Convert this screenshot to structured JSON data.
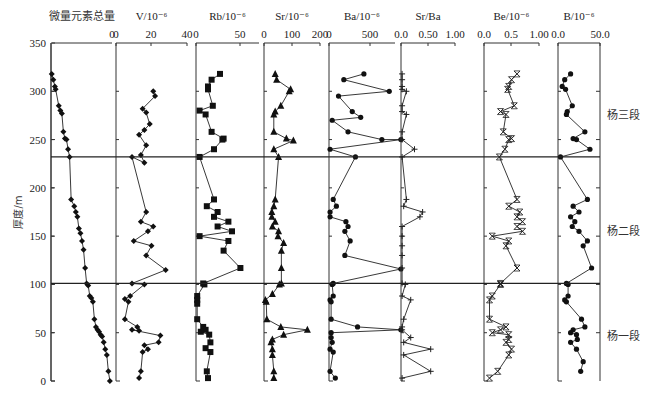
{
  "chart_data": {
    "type": "line",
    "title": "",
    "ylabel": "厚度/m",
    "ylim": [
      0,
      350
    ],
    "yticks": [
      0,
      50,
      100,
      150,
      200,
      250,
      300,
      350
    ],
    "boundaries": [
      {
        "depth": 232,
        "label": "杨三段 / 杨二段 boundary"
      },
      {
        "depth": 101,
        "label": "杨二段 / 杨一段 boundary"
      }
    ],
    "zones": [
      {
        "label": "杨三段",
        "label_depth": 275
      },
      {
        "label": "杨二段",
        "label_depth": 155
      },
      {
        "label": "杨一段",
        "label_depth": 47
      }
    ],
    "panels": [
      {
        "name": "微量元素总量",
        "marker": "diamond",
        "xlim": null,
        "xticks": [],
        "points": [
          [
            0.5,
            318
          ],
          [
            1.5,
            312
          ],
          [
            2.5,
            305
          ],
          [
            3,
            302
          ],
          [
            5,
            285
          ],
          [
            6,
            280
          ],
          [
            7,
            277
          ],
          [
            8,
            258
          ],
          [
            9,
            251
          ],
          [
            10,
            250
          ],
          [
            11,
            240
          ],
          [
            12,
            232
          ],
          [
            13,
            188
          ],
          [
            15,
            181
          ],
          [
            16,
            175
          ],
          [
            17,
            170
          ],
          [
            18,
            158
          ],
          [
            19,
            153
          ],
          [
            20,
            145
          ],
          [
            21,
            136
          ],
          [
            22,
            117
          ],
          [
            23,
            101
          ],
          [
            24,
            99
          ],
          [
            25,
            88
          ],
          [
            26,
            86
          ],
          [
            27,
            82
          ],
          [
            28,
            64
          ],
          [
            29,
            56
          ],
          [
            30,
            53
          ],
          [
            31,
            51
          ],
          [
            32,
            48
          ],
          [
            33,
            46
          ],
          [
            34,
            40
          ],
          [
            35,
            33
          ],
          [
            36,
            27
          ],
          [
            37,
            10
          ],
          [
            38,
            0
          ]
        ]
      },
      {
        "name": "V/10⁻⁶",
        "marker": "diamond",
        "xlim": [
          0,
          40
        ],
        "xticks": [
          "0",
          "20",
          "40"
        ],
        "points": [
          [
            21,
            300
          ],
          [
            22,
            295
          ],
          [
            15,
            282
          ],
          [
            17,
            278
          ],
          [
            19,
            266
          ],
          [
            16,
            260
          ],
          [
            13,
            255
          ],
          [
            17,
            244
          ],
          [
            14,
            234
          ],
          [
            16,
            226
          ],
          [
            9,
            232
          ],
          [
            17,
            175
          ],
          [
            14,
            165
          ],
          [
            21,
            160
          ],
          [
            18,
            155
          ],
          [
            10,
            145
          ],
          [
            20,
            140
          ],
          [
            17,
            130
          ],
          [
            28,
            115
          ],
          [
            9,
            101
          ],
          [
            16,
            100
          ],
          [
            8,
            88
          ],
          [
            5,
            85
          ],
          [
            7,
            82
          ],
          [
            5,
            64
          ],
          [
            12,
            56
          ],
          [
            13,
            52
          ],
          [
            9,
            53
          ],
          [
            25,
            47
          ],
          [
            24,
            40
          ],
          [
            16,
            37
          ],
          [
            18,
            33
          ],
          [
            15,
            30
          ],
          [
            14,
            10
          ],
          [
            13,
            3
          ]
        ]
      },
      {
        "name": "Rb/10⁻⁶",
        "marker": "square",
        "xlim": [
          0,
          60
        ],
        "xticks": [
          "0",
          "50"
        ],
        "points": [
          [
            20,
            318
          ],
          [
            13,
            312
          ],
          [
            10,
            305
          ],
          [
            10,
            302
          ],
          [
            14,
            285
          ],
          [
            3,
            280
          ],
          [
            8,
            276
          ],
          [
            13,
            258
          ],
          [
            23,
            251
          ],
          [
            22,
            250
          ],
          [
            15,
            240
          ],
          [
            3,
            232
          ],
          [
            15,
            188
          ],
          [
            9,
            181
          ],
          [
            18,
            175
          ],
          [
            15,
            170
          ],
          [
            27,
            165
          ],
          [
            18,
            160
          ],
          [
            30,
            155
          ],
          [
            3,
            150
          ],
          [
            27,
            145
          ],
          [
            23,
            135
          ],
          [
            37,
            117
          ],
          [
            6,
            101
          ],
          [
            7,
            100
          ],
          [
            1,
            88
          ],
          [
            1,
            84
          ],
          [
            1,
            80
          ],
          [
            1,
            64
          ],
          [
            6,
            56
          ],
          [
            8,
            53
          ],
          [
            4,
            51
          ],
          [
            11,
            48
          ],
          [
            12,
            40
          ],
          [
            8,
            34
          ],
          [
            12,
            30
          ],
          [
            9,
            10
          ],
          [
            10,
            3
          ]
        ]
      },
      {
        "name": "Sr/10⁻⁶",
        "marker": "triangle",
        "xlim": [
          0,
          200
        ],
        "xticks": [
          "0",
          "100",
          "200"
        ],
        "points": [
          [
            40,
            318
          ],
          [
            45,
            312
          ],
          [
            95,
            302
          ],
          [
            90,
            300
          ],
          [
            60,
            285
          ],
          [
            40,
            279
          ],
          [
            35,
            276
          ],
          [
            35,
            258
          ],
          [
            80,
            251
          ],
          [
            105,
            249
          ],
          [
            35,
            240
          ],
          [
            52,
            232
          ],
          [
            40,
            188
          ],
          [
            35,
            181
          ],
          [
            28,
            175
          ],
          [
            28,
            170
          ],
          [
            40,
            165
          ],
          [
            30,
            160
          ],
          [
            52,
            155
          ],
          [
            50,
            150
          ],
          [
            70,
            143
          ],
          [
            62,
            135
          ],
          [
            62,
            117
          ],
          [
            62,
            101
          ],
          [
            55,
            100
          ],
          [
            30,
            90
          ],
          [
            5,
            84
          ],
          [
            8,
            82
          ],
          [
            10,
            64
          ],
          [
            60,
            56
          ],
          [
            155,
            53
          ],
          [
            70,
            48
          ],
          [
            30,
            43
          ],
          [
            25,
            40
          ],
          [
            30,
            33
          ],
          [
            30,
            27
          ],
          [
            35,
            10
          ],
          [
            35,
            3
          ]
        ]
      },
      {
        "name": "Ba/10⁻⁶",
        "marker": "circle",
        "xlim": [
          0,
          700
        ],
        "xticks": [
          "0",
          "500"
        ],
        "points": [
          [
            330,
            318
          ],
          [
            140,
            312
          ],
          [
            570,
            300
          ],
          [
            90,
            295
          ],
          [
            220,
            279
          ],
          [
            300,
            273
          ],
          [
            30,
            270
          ],
          [
            180,
            258
          ],
          [
            500,
            250
          ],
          [
            680,
            250
          ],
          [
            10,
            240
          ],
          [
            250,
            232
          ],
          [
            40,
            188
          ],
          [
            70,
            181
          ],
          [
            10,
            175
          ],
          [
            10,
            170
          ],
          [
            160,
            165
          ],
          [
            180,
            160
          ],
          [
            150,
            155
          ],
          [
            200,
            145
          ],
          [
            150,
            130
          ],
          [
            680,
            116
          ],
          [
            40,
            101
          ],
          [
            30,
            100
          ],
          [
            40,
            88
          ],
          [
            10,
            84
          ],
          [
            20,
            82
          ],
          [
            20,
            64
          ],
          [
            270,
            56
          ],
          [
            680,
            53
          ],
          [
            20,
            50
          ],
          [
            20,
            45
          ],
          [
            30,
            40
          ],
          [
            10,
            33
          ],
          [
            40,
            30
          ],
          [
            10,
            10
          ],
          [
            60,
            3
          ]
        ]
      },
      {
        "name": "Sr/Ba",
        "marker": "plus",
        "xlim": [
          0,
          1.0
        ],
        "xticks": [
          "0.0",
          "0.50",
          "1.00"
        ],
        "points": [
          [
            0.02,
            318
          ],
          [
            0.02,
            312
          ],
          [
            0.02,
            305
          ],
          [
            0.02,
            302
          ],
          [
            0.1,
            300
          ],
          [
            0.02,
            285
          ],
          [
            0.02,
            279
          ],
          [
            0.1,
            276
          ],
          [
            0.02,
            258
          ],
          [
            0.02,
            250
          ],
          [
            0.25,
            240
          ],
          [
            0.02,
            232
          ],
          [
            0.1,
            188
          ],
          [
            0.05,
            181
          ],
          [
            0.4,
            175
          ],
          [
            0.35,
            170
          ],
          [
            0.02,
            160
          ],
          [
            0.02,
            150
          ],
          [
            0.02,
            140
          ],
          [
            0.02,
            130
          ],
          [
            0.02,
            117
          ],
          [
            0.02,
            101
          ],
          [
            0.08,
            100
          ],
          [
            0.02,
            88
          ],
          [
            0.18,
            84
          ],
          [
            0.05,
            64
          ],
          [
            0.02,
            56
          ],
          [
            0.02,
            53
          ],
          [
            0.18,
            45
          ],
          [
            0.05,
            40
          ],
          [
            0.55,
            33
          ],
          [
            0.05,
            27
          ],
          [
            0.55,
            10
          ],
          [
            0.02,
            3
          ]
        ]
      },
      {
        "name": "Be/10⁻⁶",
        "marker": "x",
        "xlim": [
          0,
          1.0
        ],
        "xticks": [
          "0.0",
          "0.5",
          "1.00"
        ],
        "points": [
          [
            0.6,
            318
          ],
          [
            0.5,
            312
          ],
          [
            0.45,
            305
          ],
          [
            0.43,
            302
          ],
          [
            0.55,
            285
          ],
          [
            0.3,
            279
          ],
          [
            0.4,
            276
          ],
          [
            0.35,
            258
          ],
          [
            0.5,
            251
          ],
          [
            0.45,
            250
          ],
          [
            0.38,
            240
          ],
          [
            0.28,
            232
          ],
          [
            0.6,
            188
          ],
          [
            0.45,
            181
          ],
          [
            0.65,
            175
          ],
          [
            0.6,
            170
          ],
          [
            0.7,
            165
          ],
          [
            0.6,
            160
          ],
          [
            0.7,
            155
          ],
          [
            0.15,
            150
          ],
          [
            0.45,
            145
          ],
          [
            0.4,
            140
          ],
          [
            0.6,
            117
          ],
          [
            0.3,
            101
          ],
          [
            0.3,
            100
          ],
          [
            0.15,
            88
          ],
          [
            0.1,
            84
          ],
          [
            0.1,
            64
          ],
          [
            0.4,
            56
          ],
          [
            0.3,
            53
          ],
          [
            0.15,
            50
          ],
          [
            0.45,
            48
          ],
          [
            0.45,
            43
          ],
          [
            0.4,
            40
          ],
          [
            0.5,
            33
          ],
          [
            0.45,
            27
          ],
          [
            0.25,
            10
          ],
          [
            0.1,
            3
          ]
        ]
      },
      {
        "name": "B/10⁻⁶",
        "marker": "circle",
        "xlim": [
          0,
          50
        ],
        "xticks": [
          "0.0",
          "50.0"
        ],
        "points": [
          [
            15,
            318
          ],
          [
            8,
            312
          ],
          [
            5,
            305
          ],
          [
            9,
            302
          ],
          [
            17,
            285
          ],
          [
            11,
            279
          ],
          [
            10,
            276
          ],
          [
            32,
            258
          ],
          [
            18,
            251
          ],
          [
            22,
            250
          ],
          [
            38,
            240
          ],
          [
            3,
            232
          ],
          [
            35,
            188
          ],
          [
            18,
            181
          ],
          [
            25,
            175
          ],
          [
            15,
            170
          ],
          [
            20,
            165
          ],
          [
            17,
            160
          ],
          [
            25,
            155
          ],
          [
            35,
            145
          ],
          [
            30,
            140
          ],
          [
            40,
            117
          ],
          [
            10,
            101
          ],
          [
            12,
            100
          ],
          [
            12,
            88
          ],
          [
            8,
            84
          ],
          [
            10,
            82
          ],
          [
            28,
            64
          ],
          [
            32,
            56
          ],
          [
            18,
            53
          ],
          [
            15,
            50
          ],
          [
            22,
            48
          ],
          [
            23,
            43
          ],
          [
            15,
            40
          ],
          [
            22,
            33
          ],
          [
            30,
            20
          ],
          [
            27,
            10
          ]
        ]
      }
    ]
  },
  "labels": {
    "ylabel": "厚度/m",
    "zone_upper": "杨三段",
    "zone_middle": "杨二段",
    "zone_lower": "杨一段"
  }
}
